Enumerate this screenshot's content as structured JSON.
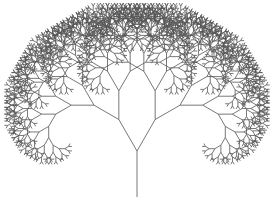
{
  "figure": {
    "subject": "fractal binary tree",
    "background_color": "#ffffff",
    "stroke_color": "#555555",
    "stroke_width": 0.8
  },
  "tree": {
    "root": {
      "x": 137,
      "y": 197
    },
    "trunk_length": 46,
    "branch_angle_deg": 30,
    "length_ratio": 0.79,
    "depth": 11
  }
}
